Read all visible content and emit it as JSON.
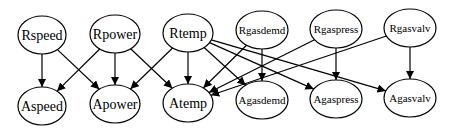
{
  "diagram": {
    "type": "directed-graph",
    "nodes": [
      {
        "id": "Rspeed",
        "label": "Rspeed",
        "cx": 42,
        "cy": 35,
        "rx": 24,
        "ry": 19,
        "fs": 14
      },
      {
        "id": "Rpower",
        "label": "Rpower",
        "cx": 115,
        "cy": 34,
        "rx": 25,
        "ry": 19,
        "fs": 14
      },
      {
        "id": "Rtemp",
        "label": "Rtemp",
        "cx": 188,
        "cy": 33,
        "rx": 25,
        "ry": 19,
        "fs": 14
      },
      {
        "id": "Rgasdemd",
        "label": "Rgasdemd",
        "cx": 262,
        "cy": 30,
        "rx": 26,
        "ry": 19,
        "fs": 11
      },
      {
        "id": "Rgaspress",
        "label": "Rgaspress",
        "cx": 336,
        "cy": 29,
        "rx": 26,
        "ry": 19,
        "fs": 11
      },
      {
        "id": "Rgasvalv",
        "label": "Rgasvalv",
        "cx": 410,
        "cy": 28,
        "rx": 26,
        "ry": 19,
        "fs": 11
      },
      {
        "id": "Aspeed",
        "label": "Aspeed",
        "cx": 42,
        "cy": 106,
        "rx": 24,
        "ry": 19,
        "fs": 14
      },
      {
        "id": "Apower",
        "label": "Apower",
        "cx": 115,
        "cy": 104,
        "rx": 25,
        "ry": 19,
        "fs": 14
      },
      {
        "id": "Atemp",
        "label": "Atemp",
        "cx": 188,
        "cy": 103,
        "rx": 25,
        "ry": 19,
        "fs": 14
      },
      {
        "id": "Agasdemd",
        "label": "Agasdemd",
        "cx": 262,
        "cy": 100,
        "rx": 26,
        "ry": 19,
        "fs": 11
      },
      {
        "id": "Agaspress",
        "label": "Agaspress",
        "cx": 336,
        "cy": 99,
        "rx": 26,
        "ry": 19,
        "fs": 11
      },
      {
        "id": "Agasvalv",
        "label": "Agasvalv",
        "cx": 410,
        "cy": 98,
        "rx": 26,
        "ry": 19,
        "fs": 11
      }
    ],
    "edges": [
      [
        "Rspeed",
        "Aspeed"
      ],
      [
        "Rspeed",
        "Apower"
      ],
      [
        "Rpower",
        "Aspeed"
      ],
      [
        "Rpower",
        "Apower"
      ],
      [
        "Rpower",
        "Atemp"
      ],
      [
        "Rtemp",
        "Apower"
      ],
      [
        "Rtemp",
        "Atemp"
      ],
      [
        "Rtemp",
        "Agasdemd"
      ],
      [
        "Rtemp",
        "Agaspress"
      ],
      [
        "Rtemp",
        "Agasvalv"
      ],
      [
        "Rgasdemd",
        "Atemp"
      ],
      [
        "Rgasdemd",
        "Agasdemd"
      ],
      [
        "Rgaspress",
        "Atemp"
      ],
      [
        "Rgaspress",
        "Agaspress"
      ],
      [
        "Rgasvalv",
        "Atemp"
      ],
      [
        "Rgasvalv",
        "Agasvalv"
      ]
    ]
  }
}
